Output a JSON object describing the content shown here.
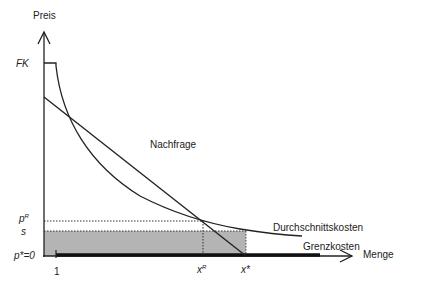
{
  "diagram": {
    "y_axis_label": "Preis",
    "x_axis_label": "Menge",
    "y_ticks": {
      "fk": "FK",
      "pr_base": "p",
      "pr_sup": "R",
      "s": "s",
      "pstar": "p*=0"
    },
    "x_ticks": {
      "one": "1",
      "xr_base": "x",
      "xr_sup": "R",
      "xstar": "x*"
    },
    "curves": {
      "demand": "Nachfrage",
      "average_cost": "Durchschnittskosten",
      "marginal_cost": "Grenzkosten"
    },
    "colors": {
      "line": "#222222",
      "shaded_area": "#b4b4b4",
      "background": "#ffffff"
    }
  }
}
